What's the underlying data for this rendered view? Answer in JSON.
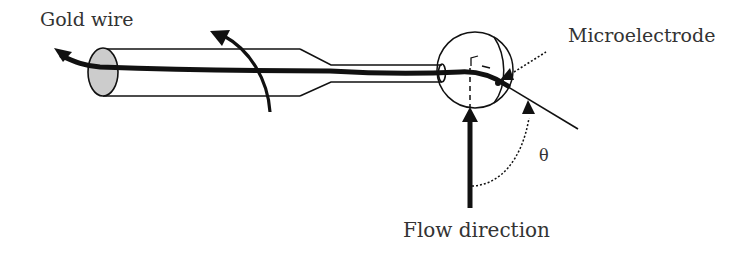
{
  "diagram": {
    "labels": {
      "gold_wire": "Gold wire",
      "microelectrode": "Microelectrode",
      "flow_direction": "Flow direction",
      "theta": "θ"
    },
    "colors": {
      "stroke": "#111111",
      "wire_end_fill": "#cccccc",
      "background": "#ffffff",
      "text": "#333333"
    },
    "elements": [
      "capillary tube with gold wire",
      "rotation arrow",
      "spherical microelectrode tip",
      "microelectrode orientation line",
      "flow direction arrow",
      "angle theta arc"
    ]
  }
}
